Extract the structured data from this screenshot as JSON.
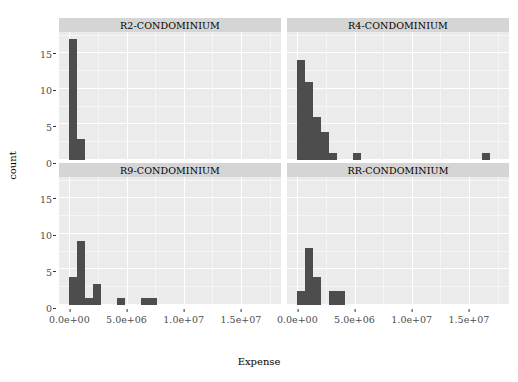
{
  "chart_data": {
    "type": "bar",
    "title": "",
    "xlabel": "Expense",
    "ylabel": "count",
    "xlim": [
      -900000,
      18500000
    ],
    "ylim": [
      0,
      18
    ],
    "grid": true,
    "legend": "none",
    "facet_layout": "2x2",
    "xticks": [
      {
        "value": 0,
        "label": "0.0e+00"
      },
      {
        "value": 5000000,
        "label": "5.0e+06"
      },
      {
        "value": 10000000,
        "label": "1.0e+07"
      },
      {
        "value": 15000000,
        "label": "1.5e+07"
      }
    ],
    "yticks": [
      {
        "value": 0,
        "label": "0"
      },
      {
        "value": 5,
        "label": "5"
      },
      {
        "value": 10,
        "label": "10"
      },
      {
        "value": 15,
        "label": "15"
      }
    ],
    "bar_color": "#4d4d4d",
    "panel_bg": "#ebebeb",
    "strip_bg": "#d5d5d5",
    "gridline_color": "#ffffff",
    "bin_width": 700000,
    "facets": [
      {
        "label": "R2-CONDOMINIUM",
        "bins": [
          {
            "x0": 0,
            "x1": 700000,
            "count": 17
          },
          {
            "x0": 700000,
            "x1": 1400000,
            "count": 3
          }
        ]
      },
      {
        "label": "R4-CONDOMINIUM",
        "bins": [
          {
            "x0": 0,
            "x1": 700000,
            "count": 14
          },
          {
            "x0": 700000,
            "x1": 1400000,
            "count": 11
          },
          {
            "x0": 1400000,
            "x1": 2100000,
            "count": 6
          },
          {
            "x0": 2100000,
            "x1": 2800000,
            "count": 4
          },
          {
            "x0": 2800000,
            "x1": 3500000,
            "count": 1
          },
          {
            "x0": 4900000,
            "x1": 5600000,
            "count": 1
          },
          {
            "x0": 16100000,
            "x1": 16800000,
            "count": 1
          }
        ]
      },
      {
        "label": "R9-CONDOMINIUM",
        "bins": [
          {
            "x0": 0,
            "x1": 700000,
            "count": 4
          },
          {
            "x0": 700000,
            "x1": 1400000,
            "count": 9
          },
          {
            "x0": 1400000,
            "x1": 2100000,
            "count": 1
          },
          {
            "x0": 2100000,
            "x1": 2800000,
            "count": 3
          },
          {
            "x0": 4200000,
            "x1": 4900000,
            "count": 1
          },
          {
            "x0": 6300000,
            "x1": 7700000,
            "count": 1
          }
        ]
      },
      {
        "label": "RR-CONDOMINIUM",
        "bins": [
          {
            "x0": 0,
            "x1": 700000,
            "count": 2
          },
          {
            "x0": 700000,
            "x1": 1400000,
            "count": 8
          },
          {
            "x0": 1400000,
            "x1": 2100000,
            "count": 4
          },
          {
            "x0": 2800000,
            "x1": 4200000,
            "count": 2
          }
        ]
      }
    ]
  }
}
